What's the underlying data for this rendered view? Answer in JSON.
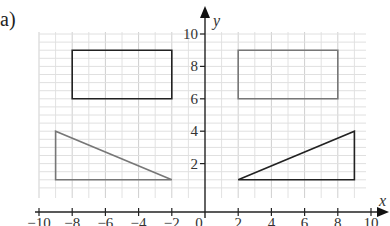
{
  "part_label": "a)",
  "chart_data": {
    "type": "scatter",
    "title": "",
    "xlabel": "x",
    "ylabel": "y",
    "xlim": [
      -10,
      10
    ],
    "ylim": [
      0,
      10
    ],
    "grid": true,
    "x_ticks": [
      -10,
      -8,
      -6,
      -4,
      -2,
      0,
      2,
      4,
      6,
      8,
      10
    ],
    "x_tick_labels": [
      "−10",
      "−8",
      "−6",
      "−4",
      "−2",
      "0",
      "2",
      "4",
      "6",
      "8",
      "10"
    ],
    "y_ticks": [
      2,
      4,
      6,
      8,
      10
    ],
    "y_tick_labels": [
      "2",
      "4",
      "6",
      "8",
      "10"
    ],
    "shapes": [
      {
        "name": "rectangle-left",
        "kind": "polygon",
        "color": "#222222",
        "points": [
          [
            -8,
            6
          ],
          [
            -2,
            6
          ],
          [
            -2,
            9
          ],
          [
            -8,
            9
          ]
        ]
      },
      {
        "name": "rectangle-right",
        "kind": "polygon",
        "color": "#777777",
        "points": [
          [
            2,
            6
          ],
          [
            8,
            6
          ],
          [
            8,
            9
          ],
          [
            2,
            9
          ]
        ]
      },
      {
        "name": "triangle-left",
        "kind": "polygon",
        "color": "#777777",
        "points": [
          [
            -9,
            1
          ],
          [
            -2,
            1
          ],
          [
            -9,
            4
          ]
        ]
      },
      {
        "name": "triangle-right",
        "kind": "polygon",
        "color": "#222222",
        "points": [
          [
            2,
            1
          ],
          [
            9,
            1
          ],
          [
            9,
            4
          ]
        ]
      }
    ]
  }
}
